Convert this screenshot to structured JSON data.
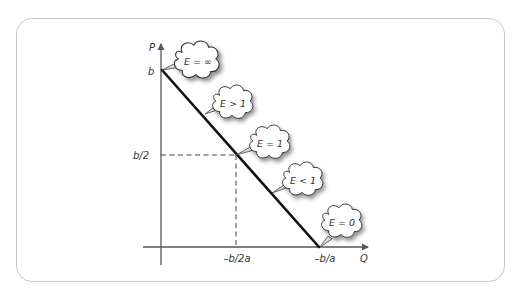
{
  "diagram": {
    "type": "linear demand curve with price elasticity regions",
    "axes": {
      "y_label": "P",
      "x_label": "Q"
    },
    "ticks": {
      "y_intercept": "b",
      "y_mid": "b/2",
      "x_mid": "–b/2a",
      "x_intercept": "–b/a"
    },
    "elasticity_labels": [
      {
        "id": "infinite",
        "text": "E = ∞"
      },
      {
        "id": "elastic",
        "text": "E > 1"
      },
      {
        "id": "unit",
        "text": "E = 1"
      },
      {
        "id": "inelastic",
        "text": "E < 1"
      },
      {
        "id": "zero",
        "text": "E = 0"
      }
    ],
    "colors": {
      "frame_border": "#c8c8c8",
      "axis": "#555555",
      "demand_line": "#111111",
      "dashed_guides": "#444444",
      "cloud_fill": "#ffffff",
      "cloud_stroke": "#333333",
      "text": "#333333"
    }
  }
}
